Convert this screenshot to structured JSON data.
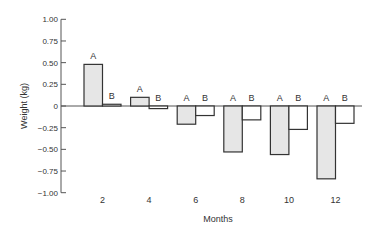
{
  "chart_data": {
    "type": "bar",
    "title": "",
    "xlabel": "Months",
    "ylabel": "Weight (kg)",
    "ylim": [
      -1.0,
      1.0
    ],
    "yticks": [
      1.0,
      0.75,
      0.5,
      0.25,
      0,
      -0.25,
      -0.5,
      -0.75,
      -1.0
    ],
    "ytick_labels": [
      "1.00",
      "0.75",
      "0.50",
      "0.25",
      "0",
      "-0.25",
      "-0.50",
      "-0.75",
      "-1.00"
    ],
    "categories": [
      "2",
      "4",
      "6",
      "8",
      "10",
      "12"
    ],
    "series": [
      {
        "name": "A",
        "values": [
          0.48,
          0.1,
          -0.21,
          -0.53,
          -0.56,
          -0.84
        ],
        "fill": "#e6e6e6",
        "stroke": "#333333"
      },
      {
        "name": "B",
        "values": [
          0.02,
          -0.03,
          -0.11,
          -0.16,
          -0.27,
          -0.2
        ],
        "fill": "#ffffff",
        "stroke": "#333333"
      }
    ],
    "bar_labels": "series name above each bar group",
    "grid": false,
    "legend": "none (bars labelled A/B directly)"
  },
  "colors": {
    "axis": "#555555",
    "text": "#333333",
    "bar_a_fill": "#e6e6e6",
    "bar_b_fill": "#ffffff",
    "bar_stroke": "#333333"
  }
}
